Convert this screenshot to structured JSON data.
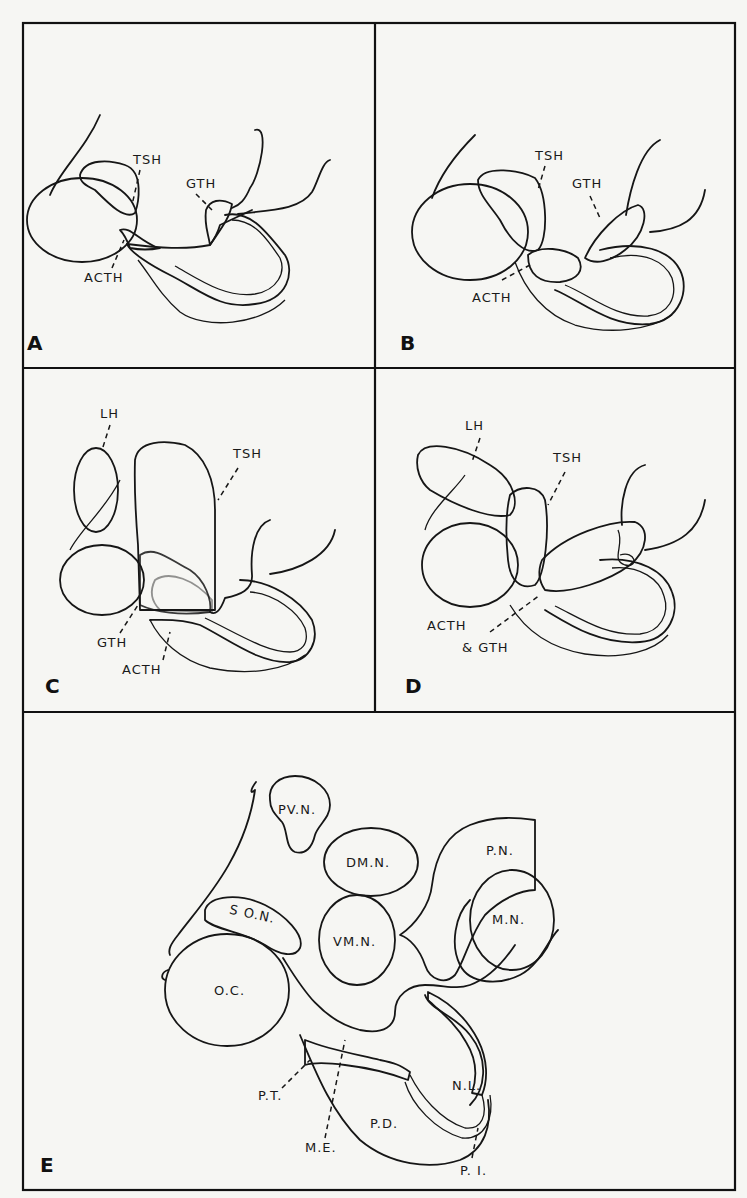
{
  "figure": {
    "panels": [
      {
        "id": "A",
        "letter": "A",
        "labels": {
          "tsh": "TSH",
          "gth": "GTH",
          "acth": "ACTH"
        }
      },
      {
        "id": "B",
        "letter": "B",
        "labels": {
          "tsh": "TSH",
          "gth": "GTH",
          "acth": "ACTH"
        }
      },
      {
        "id": "C",
        "letter": "C",
        "labels": {
          "lh": "LH",
          "tsh": "TSH",
          "gth": "GTH",
          "acth": "ACTH"
        }
      },
      {
        "id": "D",
        "letter": "D",
        "labels": {
          "lh": "LH",
          "tsh": "TSH",
          "acth": "ACTH",
          "gth": "& GTH"
        }
      },
      {
        "id": "E",
        "letter": "E",
        "labels": {
          "pvn": "PV.N.",
          "dmn": "DM.N.",
          "pn": "P.N.",
          "son": "S O.N.",
          "vmn": "VM.N.",
          "mn": "M.N.",
          "oc": "O.C.",
          "pt": "P.T.",
          "me": "M.E.",
          "pd": "P.D.",
          "nl": "N.L.",
          "pi": "P. I."
        }
      }
    ],
    "legend_patterns": {
      "tsh": "diagonal-hatch",
      "gth": "horizontal-hatch",
      "acth": "vertical-hatch",
      "lh": "dot-stipple",
      "nuclei": "fine-stipple"
    },
    "colors": {
      "ink": "#161616",
      "paper": "#f6f6f3",
      "stipple": "#d9d9d4"
    }
  }
}
